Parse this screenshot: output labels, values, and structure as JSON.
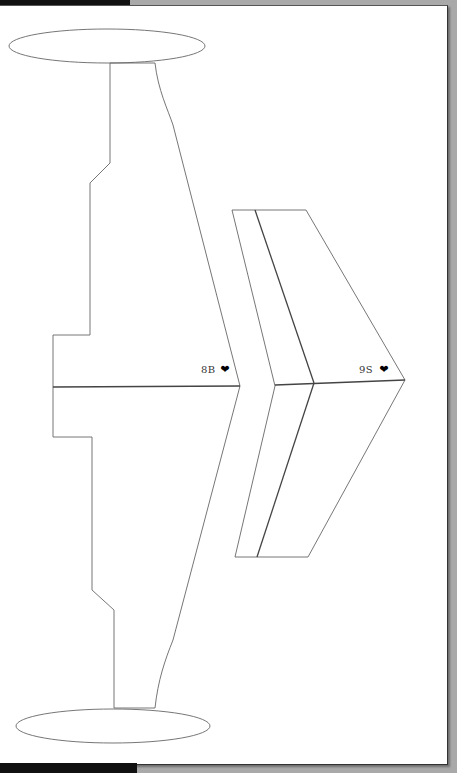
{
  "document": {
    "type": "paper airplane cutout template (scanned)",
    "background_color": "#a9a9a9",
    "paper_color": "#ffffff",
    "line_color": "#555555"
  },
  "parts": {
    "fuselage": {
      "label": "8B",
      "marker": "❥"
    },
    "wing": {
      "label": "9S",
      "marker": "❥"
    },
    "top_ellipse": "tail-ellipse",
    "bottom_ellipse": "tail-ellipse"
  }
}
